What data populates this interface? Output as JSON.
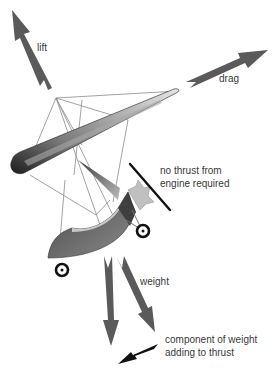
{
  "diagram": {
    "labels": {
      "lift": "lift",
      "drag": "drag",
      "no_thrust_line1": "no thrust from",
      "no_thrust_line2": "engine required",
      "weight": "weight",
      "component_line1": "component of weight",
      "component_line2": "adding to thrust"
    },
    "colors": {
      "force_arrow": "#5a5a5a",
      "thrust_component_arrow": "#111111",
      "wing_dark": "#2a2a2a",
      "wing_light": "#d8d8d8",
      "rigging": "#8a8a8a",
      "pod": "#6a6a6a",
      "pod_fairing": "#c8c8c8",
      "engine": "#bdbdbd",
      "propeller": "#111111",
      "wheel": "#111111",
      "background": "#ffffff"
    },
    "icons": {
      "lift_arrow": "arrow-up-left",
      "drag_arrow": "arrow-up-right",
      "weight_arrow": "arrow-down",
      "weight_component_arrow": "arrow-down-right",
      "thrust_component_arrow": "arrow-down-left"
    }
  }
}
